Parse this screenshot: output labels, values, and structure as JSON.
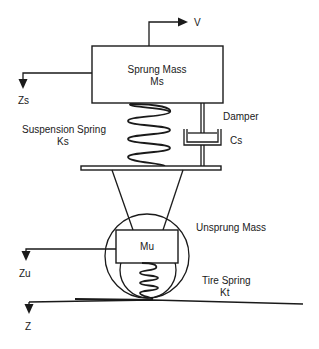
{
  "diagram": {
    "sprung_mass": {
      "label": "Sprung Mass",
      "symbol": "Ms"
    },
    "velocity": {
      "label": "V"
    },
    "sprung_displacement": {
      "label": "Zs"
    },
    "suspension_spring": {
      "label": "Suspension Spring",
      "symbol": "Ks"
    },
    "damper": {
      "label": "Damper",
      "symbol": "Cs"
    },
    "unsprung_mass": {
      "label": "Unsprung Mass",
      "symbol": "Mu"
    },
    "unsprung_displacement": {
      "label": "Zu"
    },
    "tire_spring": {
      "label": "Tire Spring",
      "symbol": "Kt"
    },
    "road_displacement": {
      "label": "Z"
    },
    "colors": {
      "stroke": "#1a1a1a",
      "background": "#ffffff"
    }
  }
}
